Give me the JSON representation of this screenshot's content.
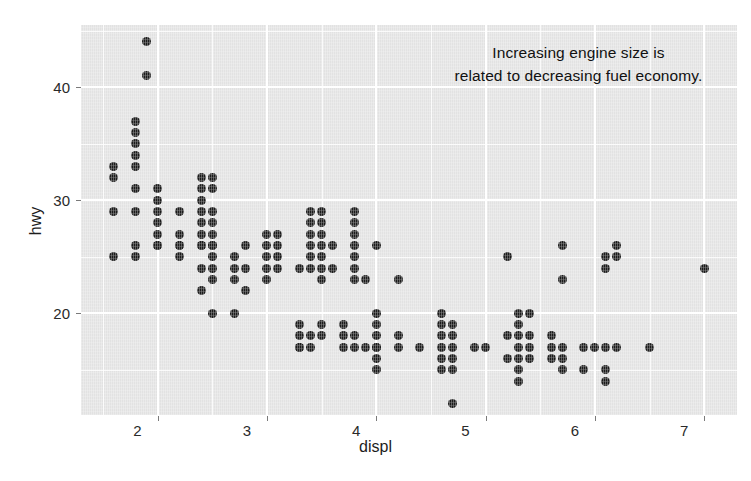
{
  "chart_data": {
    "type": "scatter",
    "title": "",
    "xlabel": "displ",
    "ylabel": "hwy",
    "xlim": [
      1.3,
      7.3
    ],
    "ylim": [
      11,
      45.5
    ],
    "xticks": [
      "2",
      "3",
      "4",
      "5",
      "6",
      "7"
    ],
    "xtick_values": [
      2,
      3,
      4,
      5,
      6,
      7
    ],
    "yticks": [
      "20",
      "30",
      "40"
    ],
    "ytick_values": [
      20,
      30,
      40
    ],
    "xminor_values": [
      1.5,
      2.5,
      3.5,
      4.5,
      5.5,
      6.5
    ],
    "yminor_values": [
      15,
      25,
      35,
      45
    ],
    "grid": true,
    "legend": "none",
    "panel_color": "#e2e2e2",
    "grid_color": "#ffffff",
    "point_color": "#1b1b1b",
    "annotations": [
      {
        "name": "trend-annotation",
        "line1": "Increasing engine size is",
        "line2": "related to decreasing fuel economy.",
        "x": 5.85,
        "y": 43.0
      }
    ],
    "series": [
      {
        "name": "mpg",
        "points": [
          [
            1.6,
            33
          ],
          [
            1.6,
            32
          ],
          [
            1.6,
            29
          ],
          [
            1.6,
            25
          ],
          [
            1.8,
            37
          ],
          [
            1.8,
            36
          ],
          [
            1.8,
            35
          ],
          [
            1.8,
            34
          ],
          [
            1.8,
            33
          ],
          [
            1.8,
            31
          ],
          [
            1.8,
            29
          ],
          [
            1.8,
            26
          ],
          [
            1.8,
            25
          ],
          [
            1.9,
            44
          ],
          [
            1.9,
            41
          ],
          [
            2.0,
            31
          ],
          [
            2.0,
            30
          ],
          [
            2.0,
            29
          ],
          [
            2.0,
            28
          ],
          [
            2.0,
            27
          ],
          [
            2.0,
            26
          ],
          [
            2.0,
            26
          ],
          [
            2.2,
            29
          ],
          [
            2.2,
            27
          ],
          [
            2.2,
            26
          ],
          [
            2.2,
            26
          ],
          [
            2.2,
            25
          ],
          [
            2.4,
            32
          ],
          [
            2.4,
            31
          ],
          [
            2.4,
            30
          ],
          [
            2.4,
            29
          ],
          [
            2.4,
            28
          ],
          [
            2.4,
            27
          ],
          [
            2.4,
            26
          ],
          [
            2.4,
            26
          ],
          [
            2.4,
            24
          ],
          [
            2.4,
            22
          ],
          [
            2.5,
            32
          ],
          [
            2.5,
            31
          ],
          [
            2.5,
            29
          ],
          [
            2.5,
            28
          ],
          [
            2.5,
            27
          ],
          [
            2.5,
            26
          ],
          [
            2.5,
            26
          ],
          [
            2.5,
            25
          ],
          [
            2.5,
            24
          ],
          [
            2.5,
            23
          ],
          [
            2.5,
            20
          ],
          [
            2.7,
            25
          ],
          [
            2.7,
            24
          ],
          [
            2.7,
            23
          ],
          [
            2.7,
            20
          ],
          [
            2.8,
            26
          ],
          [
            2.8,
            24
          ],
          [
            2.8,
            22
          ],
          [
            3.0,
            27
          ],
          [
            3.0,
            26
          ],
          [
            3.0,
            25
          ],
          [
            3.0,
            24
          ],
          [
            3.0,
            23
          ],
          [
            3.1,
            27
          ],
          [
            3.1,
            26
          ],
          [
            3.1,
            25
          ],
          [
            3.1,
            24
          ],
          [
            3.3,
            24
          ],
          [
            3.3,
            19
          ],
          [
            3.3,
            18
          ],
          [
            3.3,
            17
          ],
          [
            3.3,
            17
          ],
          [
            3.4,
            29
          ],
          [
            3.4,
            28
          ],
          [
            3.4,
            27
          ],
          [
            3.4,
            26
          ],
          [
            3.4,
            25
          ],
          [
            3.4,
            24
          ],
          [
            3.4,
            18
          ],
          [
            3.4,
            17
          ],
          [
            3.5,
            29
          ],
          [
            3.5,
            28
          ],
          [
            3.5,
            27
          ],
          [
            3.5,
            26
          ],
          [
            3.5,
            25
          ],
          [
            3.5,
            24
          ],
          [
            3.5,
            23
          ],
          [
            3.5,
            19
          ],
          [
            3.5,
            18
          ],
          [
            3.6,
            26
          ],
          [
            3.6,
            24
          ],
          [
            3.7,
            19
          ],
          [
            3.7,
            18
          ],
          [
            3.7,
            17
          ],
          [
            3.8,
            29
          ],
          [
            3.8,
            28
          ],
          [
            3.8,
            27
          ],
          [
            3.8,
            26
          ],
          [
            3.8,
            25
          ],
          [
            3.8,
            24
          ],
          [
            3.8,
            23
          ],
          [
            3.8,
            18
          ],
          [
            3.8,
            17
          ],
          [
            3.9,
            23
          ],
          [
            3.9,
            17
          ],
          [
            4.0,
            26
          ],
          [
            4.0,
            20
          ],
          [
            4.0,
            19
          ],
          [
            4.0,
            18
          ],
          [
            4.0,
            17
          ],
          [
            4.0,
            17
          ],
          [
            4.0,
            16
          ],
          [
            4.0,
            15
          ],
          [
            4.2,
            23
          ],
          [
            4.2,
            18
          ],
          [
            4.2,
            17
          ],
          [
            4.4,
            17
          ],
          [
            4.6,
            20
          ],
          [
            4.6,
            19
          ],
          [
            4.6,
            18
          ],
          [
            4.6,
            17
          ],
          [
            4.6,
            16
          ],
          [
            4.6,
            15
          ],
          [
            4.7,
            19
          ],
          [
            4.7,
            18
          ],
          [
            4.7,
            17
          ],
          [
            4.7,
            16
          ],
          [
            4.7,
            15
          ],
          [
            4.7,
            12
          ],
          [
            4.9,
            17
          ],
          [
            5.0,
            17
          ],
          [
            5.2,
            25
          ],
          [
            5.2,
            18
          ],
          [
            5.2,
            16
          ],
          [
            5.3,
            20
          ],
          [
            5.3,
            19
          ],
          [
            5.3,
            18
          ],
          [
            5.3,
            17
          ],
          [
            5.3,
            16
          ],
          [
            5.3,
            15
          ],
          [
            5.3,
            14
          ],
          [
            5.4,
            20
          ],
          [
            5.4,
            18
          ],
          [
            5.4,
            17
          ],
          [
            5.4,
            16
          ],
          [
            5.6,
            18
          ],
          [
            5.6,
            17
          ],
          [
            5.6,
            16
          ],
          [
            5.7,
            26
          ],
          [
            5.7,
            23
          ],
          [
            5.7,
            17
          ],
          [
            5.7,
            16
          ],
          [
            5.7,
            15
          ],
          [
            5.9,
            17
          ],
          [
            5.9,
            15
          ],
          [
            6.0,
            17
          ],
          [
            6.1,
            25
          ],
          [
            6.1,
            24
          ],
          [
            6.1,
            17
          ],
          [
            6.1,
            15
          ],
          [
            6.1,
            14
          ],
          [
            6.2,
            26
          ],
          [
            6.2,
            25
          ],
          [
            6.2,
            17
          ],
          [
            6.5,
            17
          ],
          [
            7.0,
            24
          ]
        ]
      }
    ]
  }
}
